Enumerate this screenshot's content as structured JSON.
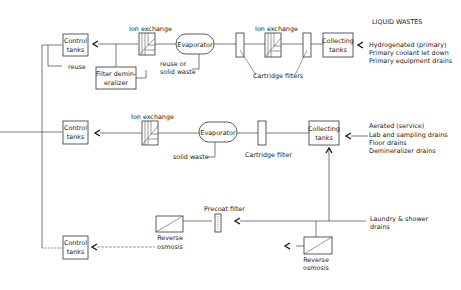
{
  "title": "LIQUID WASTES",
  "rows": [
    {
      "id": "primary",
      "sources": [
        "Hydrogenated (primary)",
        "Primary coolant let down",
        "Primary equipment drains"
      ],
      "collecting_tanks": [
        "Collecting",
        "tanks"
      ],
      "cartridge_filters_label": "Cartridge filters",
      "ion_exchange_right_label": "Ion exchange",
      "evaporator_label": "Evaporator",
      "evaporator_output": [
        "reuse or",
        "solid waste"
      ],
      "ion_exchange_left_label": "Ion exchange",
      "filter_demineralizer": [
        "Filter demin-",
        "eralizer"
      ],
      "control_tanks": [
        "Control",
        "tanks"
      ],
      "reuse_label": "reuse"
    },
    {
      "id": "service",
      "sources": [
        "Aerated (service)",
        "Lab and sampling drains",
        "Floor drains",
        "Demineralizer drains"
      ],
      "collecting_tanks": [
        "Collecting",
        "tanks"
      ],
      "cartridge_filter_label": "Cartridge filter",
      "evaporator_label": "Evaporator",
      "evaporator_output": "solid waste",
      "ion_exchange_label": "Ion exchange",
      "control_tanks": [
        "Control",
        "tanks"
      ]
    },
    {
      "id": "laundry",
      "sources": [
        "Laundry & shower",
        "drains"
      ],
      "precoat_filter_label": "Precoat filter",
      "reverse_osmosis_left": [
        "Reverse",
        "osmosis"
      ],
      "reverse_osmosis_right": [
        "Reverse",
        "osmosis"
      ],
      "control_tanks": [
        "Control",
        "tanks"
      ]
    }
  ]
}
